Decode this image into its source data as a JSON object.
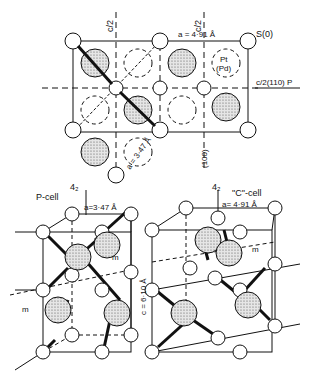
{
  "top_view": {
    "label_c2_left": "c/2",
    "label_c2_right": "c/2",
    "label_a": "a = 4·91 Å",
    "label_s": "S(0)",
    "label_pt": "Pt",
    "label_pd": "(Pd)",
    "label_plane": "c/2(110) P",
    "label_100": "(100)",
    "label_a_diag": "a = 3·47 Å"
  },
  "p_cell": {
    "label_axis": "4₂",
    "label_title": "P-cell",
    "label_a": "a=3·47 Å",
    "label_m": "m",
    "label_m2": "m"
  },
  "c_cell": {
    "label_axis": "4₂",
    "label_title": "\"C\"-cell",
    "label_a": "a= 4·91 Å",
    "label_c": "c = 6·10 Å",
    "label_m": "m"
  },
  "colors": {
    "line": "#111111",
    "stipple": "#c8c8c8",
    "background": "#ffffff"
  }
}
